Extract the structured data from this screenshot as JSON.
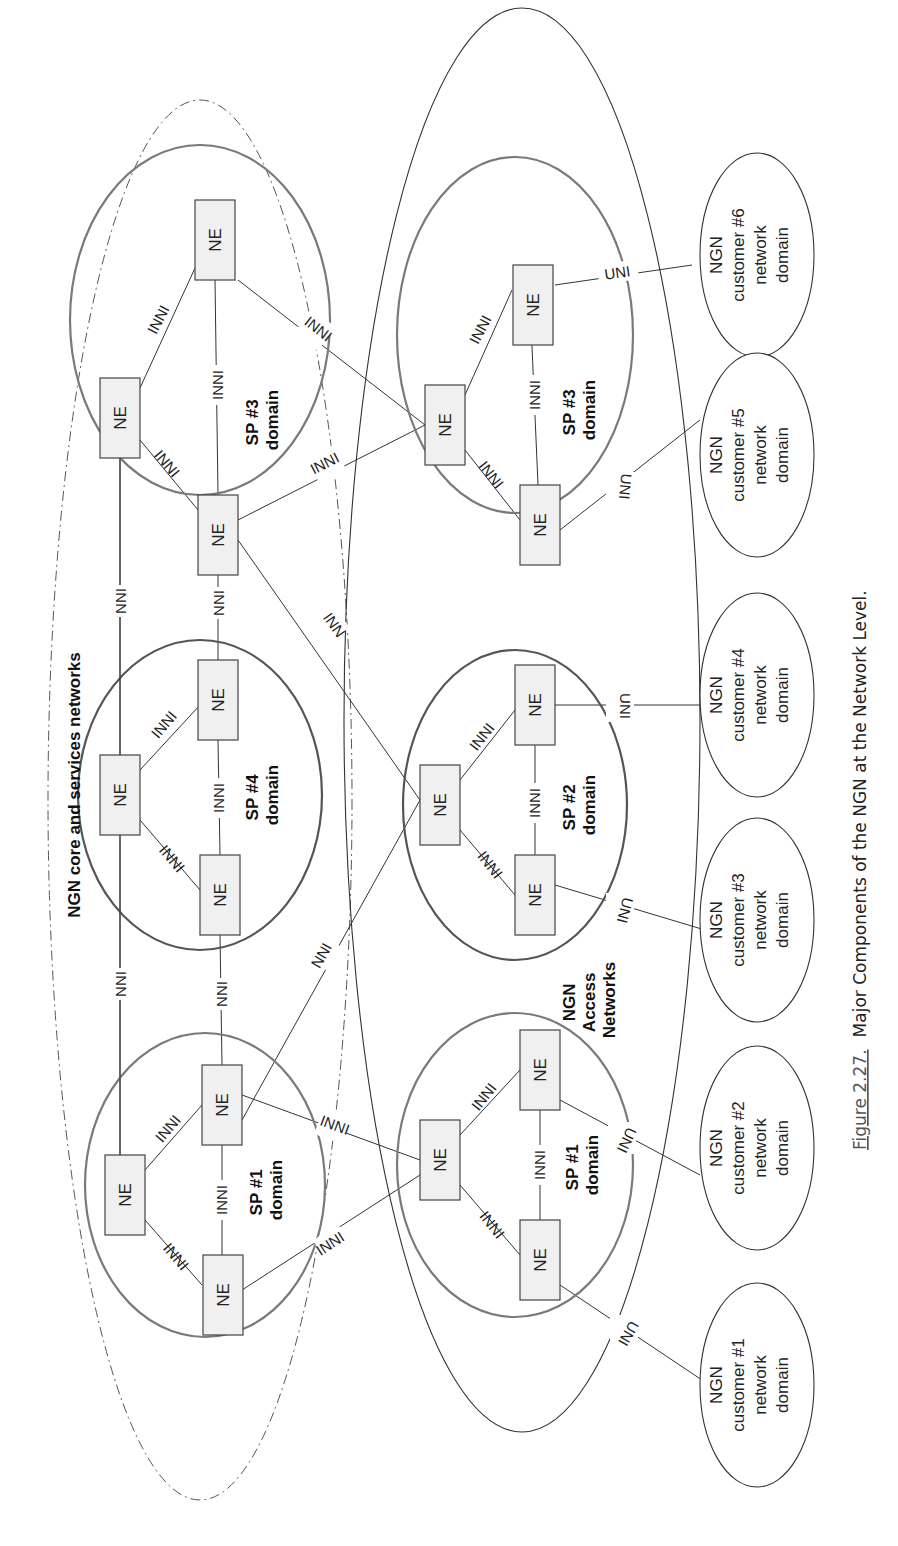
{
  "figure": {
    "caption_prefix": "Figure 2.27.",
    "caption_text": "Major Components of the NGN at the Network Level."
  },
  "regions": {
    "core": {
      "label": "NGN core and services networks"
    },
    "access": {
      "label_lines": [
        "NGN",
        "Access",
        "Networks"
      ]
    }
  },
  "ne_label": "NE",
  "link_types": {
    "inni": "INNI",
    "nni": "NNI",
    "uni": "UNI",
    "truncated_inni": "INN"
  },
  "core_domains": [
    {
      "id": "core-sp3",
      "label_lines": [
        "SP #3",
        "domain"
      ]
    },
    {
      "id": "core-sp4",
      "label_lines": [
        "SP #4",
        "domain"
      ]
    },
    {
      "id": "core-sp1",
      "label_lines": [
        "SP #1",
        "domain"
      ]
    }
  ],
  "access_domains": [
    {
      "id": "access-sp3",
      "label_lines": [
        "SP #3",
        "domain"
      ]
    },
    {
      "id": "access-sp2",
      "label_lines": [
        "SP #2",
        "domain"
      ]
    },
    {
      "id": "access-sp1",
      "label_lines": [
        "SP #1",
        "domain"
      ]
    }
  ],
  "customers": [
    {
      "id": "customer-6",
      "label_lines": [
        "NGN",
        "customer #6",
        "network",
        "domain"
      ]
    },
    {
      "id": "customer-5",
      "label_lines": [
        "NGN",
        "customer #5",
        "network",
        "domain"
      ]
    },
    {
      "id": "customer-4",
      "label_lines": [
        "NGN",
        "customer #4",
        "network",
        "domain"
      ]
    },
    {
      "id": "customer-3",
      "label_lines": [
        "NGN",
        "customer #3",
        "network",
        "domain"
      ]
    },
    {
      "id": "customer-2",
      "label_lines": [
        "NGN",
        "customer #2",
        "network",
        "domain"
      ]
    },
    {
      "id": "customer-1",
      "label_lines": [
        "NGN",
        "customer #1",
        "network",
        "domain"
      ]
    }
  ]
}
